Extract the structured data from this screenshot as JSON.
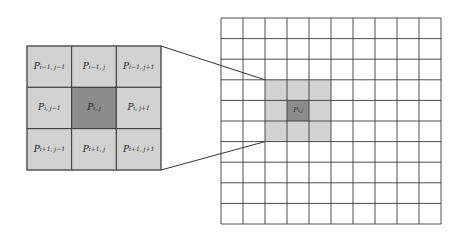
{
  "diagram": {
    "type": "pixel-neighborhood",
    "colors": {
      "background": "#ffffff",
      "grid_line": "#3a3a3a",
      "neighbor_fill": "#d2d2d2",
      "center_fill": "#8c8c8c",
      "connector": "#333333"
    },
    "zoomed_neighborhood": {
      "rows": 3,
      "cols": 3,
      "cells": [
        [
          {
            "symbol": "P",
            "sub": "i−1, j−1"
          },
          {
            "symbol": "P",
            "sub": "i−1, j"
          },
          {
            "symbol": "P",
            "sub": "i−1, j+1"
          }
        ],
        [
          {
            "symbol": "P",
            "sub": "i, j−1"
          },
          {
            "symbol": "P",
            "sub": "i, j"
          },
          {
            "symbol": "P",
            "sub": "i, j+1"
          }
        ],
        [
          {
            "symbol": "P",
            "sub": "i+1, j−1"
          },
          {
            "symbol": "P",
            "sub": "i+1, j"
          },
          {
            "symbol": "P",
            "sub": "i+1, j+1"
          }
        ]
      ]
    },
    "image_grid": {
      "rows": 10,
      "cols": 10,
      "highlight": {
        "row_start": 3,
        "col_start": 2,
        "size": 3
      },
      "center": {
        "row": 4,
        "col": 3,
        "symbol": "P",
        "sub": "i, j"
      }
    }
  }
}
